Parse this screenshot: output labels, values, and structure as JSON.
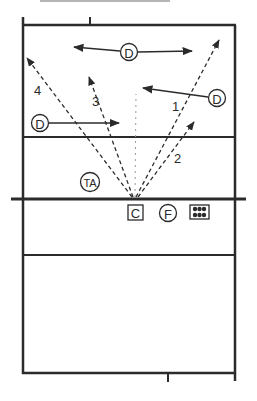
{
  "diagram": {
    "type": "volleyball-court-play",
    "colors": {
      "ink": "#2b2b2b",
      "background": "#ffffff",
      "faint": "#9a9a9a"
    },
    "players": [
      {
        "id": "d-top",
        "label": "D",
        "shape": "circle"
      },
      {
        "id": "d-right",
        "label": "D",
        "shape": "circle"
      },
      {
        "id": "d-left",
        "label": "D",
        "shape": "circle"
      },
      {
        "id": "ta",
        "label": "TA",
        "shape": "circle"
      },
      {
        "id": "c",
        "label": "C",
        "shape": "square"
      },
      {
        "id": "f",
        "label": "F",
        "shape": "circle"
      },
      {
        "id": "ball-cart",
        "label": "",
        "shape": "grid-3x2"
      }
    ],
    "attack_paths": [
      {
        "label": "1"
      },
      {
        "label": "2"
      },
      {
        "label": "3"
      },
      {
        "label": "4"
      }
    ]
  }
}
